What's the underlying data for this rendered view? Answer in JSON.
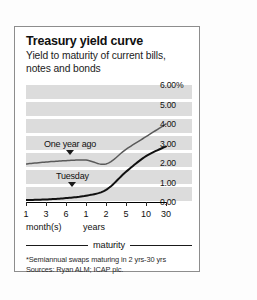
{
  "card": {
    "title": "Treasury yield curve",
    "subtitle": "Yield to maturity of current bills, notes and bonds",
    "maturity_label": "maturity",
    "footnote_1": "*Semiannual swaps maturing in 2 yrs-30 yrs",
    "footnote_2": "Sources: Ryan ALM; ICAP plc."
  },
  "chart_data": {
    "type": "line",
    "title": "Treasury yield curve",
    "subtitle": "Yield to maturity of current bills, notes and bonds",
    "xlabel": "maturity",
    "ylabel": "",
    "ylim": [
      0.0,
      6.0
    ],
    "yticks": [
      0.0,
      1.0,
      2.0,
      3.0,
      4.0,
      5.0,
      6.0
    ],
    "ytick_labels": [
      "0.00",
      "1.00",
      "2.00",
      "3.00",
      "4.00",
      "5.00",
      "6.00%"
    ],
    "grid": true,
    "legend": "annotations",
    "categories": [
      "1",
      "3",
      "6",
      "1",
      "2",
      "5",
      "10",
      "30"
    ],
    "category_groups": [
      {
        "label": "month(s)",
        "members": [
          "1",
          "3",
          "6"
        ]
      },
      {
        "label": "years",
        "members": [
          "1",
          "2",
          "5",
          "10",
          "30"
        ]
      }
    ],
    "series": [
      {
        "name": "One year ago",
        "values": [
          1.95,
          2.05,
          2.12,
          2.15,
          1.95,
          2.7,
          3.35,
          4.0
        ],
        "color": "#5a5a5a"
      },
      {
        "name": "Tuesday",
        "values": [
          0.1,
          0.13,
          0.2,
          0.32,
          0.62,
          1.55,
          2.35,
          2.85
        ],
        "color": "#111111"
      }
    ],
    "annotations": [
      {
        "text": "One year ago",
        "points_to": "One year ago"
      },
      {
        "text": "Tuesday",
        "points_to": "Tuesday"
      }
    ],
    "colors": {
      "band": "#dcdcdc",
      "gridline": "#ffffff",
      "axis": "#000000"
    }
  }
}
